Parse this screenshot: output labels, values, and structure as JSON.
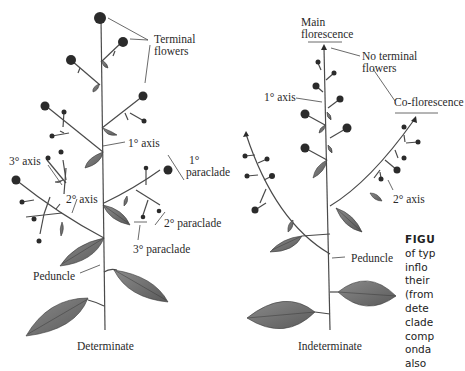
{
  "figure": {
    "left_panel": {
      "title": "Determinate",
      "labels": {
        "terminal_flowers": [
          "Terminal",
          "flowers"
        ],
        "primary_axis": "1° axis",
        "primary_paraclade": [
          "1°",
          "paraclade"
        ],
        "tertiary_axis": "3° axis",
        "secondary_axis": "2° axis",
        "secondary_paraclade": "2° paraclade",
        "tertiary_paraclade": "3° paraclade",
        "peduncle": "Peduncle"
      }
    },
    "right_panel": {
      "title": "Indeterminate",
      "labels": {
        "main_florescence": [
          "Main",
          "florescence"
        ],
        "no_terminal_flowers": [
          "No terminal",
          "flowers"
        ],
        "primary_axis": "1° axis",
        "co_florescence": "Co-florescence",
        "secondary_axis": "2° axis",
        "peduncle": "Peduncle"
      }
    },
    "caption_fragment": {
      "title": "FIGU",
      "lines": [
        "of typ",
        "inflo",
        "their",
        "(from",
        "dete",
        "clade",
        "comp",
        "onda",
        "also"
      ]
    },
    "colors": {
      "stem": "#4a4a4a",
      "flower": "#2b2b2b",
      "leaf": "#6e6e6e",
      "leaf_vein": "#3a3a3a",
      "text": "#2a2a2a"
    }
  }
}
